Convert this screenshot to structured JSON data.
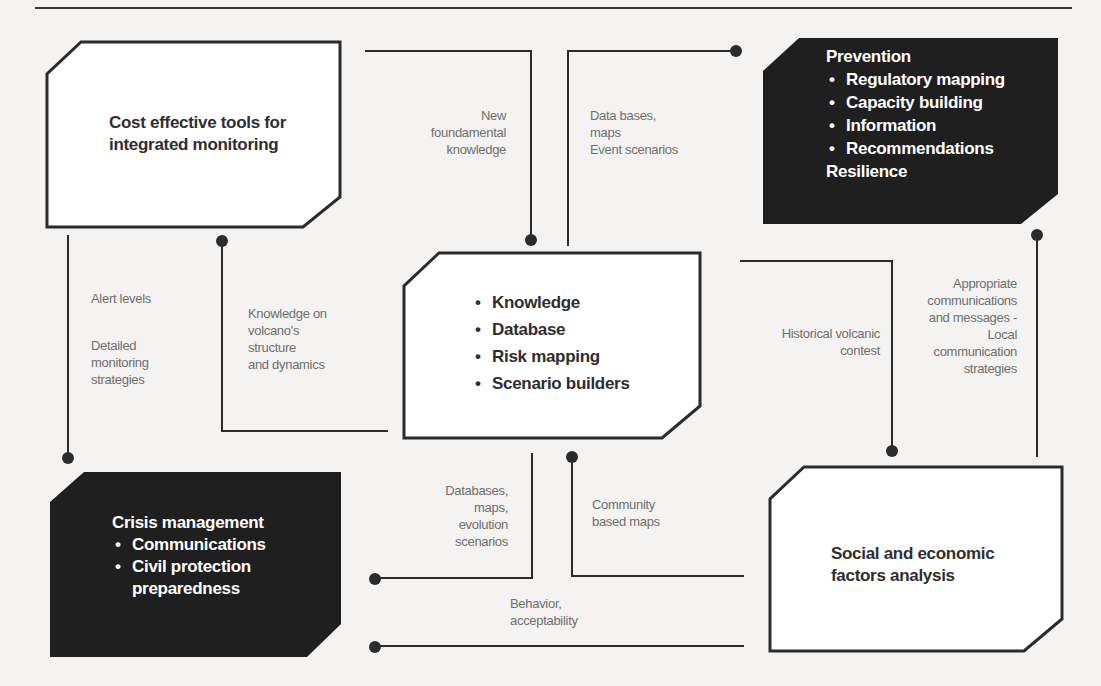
{
  "nodes": {
    "monitoring": {
      "title": "Cost effective tools for integrated monitoring",
      "line1": "Cost effective tools for",
      "line2": "integrated monitoring",
      "style": "light"
    },
    "prevention": {
      "title": "Prevention",
      "items": [
        "Regulatory mapping",
        "Capacity building",
        "Information",
        "Recommendations"
      ],
      "footer": "Resilience",
      "style": "dark"
    },
    "core": {
      "items": [
        "Knowledge",
        "Database",
        "Risk mapping",
        "Scenario builders"
      ],
      "style": "light"
    },
    "crisis": {
      "title": "Crisis management",
      "items": [
        "Communications",
        "Civil protection preparedness"
      ],
      "item2_line1": "Civil protection",
      "item2_line2": "preparedness",
      "style": "dark"
    },
    "social": {
      "line1": "Social and economic",
      "line2": "factors analysis",
      "style": "light"
    }
  },
  "edges": {
    "new_knowledge": {
      "lines": [
        "New",
        "foundamental",
        "knowledge"
      ]
    },
    "data_bases_maps": {
      "lines": [
        "Data bases,",
        "maps",
        "Event scenarios"
      ]
    },
    "alert_levels": {
      "lines": [
        "Alert levels"
      ]
    },
    "detailed_monitoring": {
      "lines": [
        "Detailed",
        "monitoring",
        "strategies"
      ]
    },
    "volcano_knowledge": {
      "lines": [
        "Knowledge on",
        "volcano's",
        "structure",
        "and dynamics"
      ]
    },
    "historical_context": {
      "lines": [
        "Historical volcanic",
        "contest"
      ]
    },
    "appropriate_comms": {
      "lines": [
        "Appropriate",
        "communications",
        "and messages -",
        "Local",
        "communication",
        "strategies"
      ]
    },
    "databases_evolution": {
      "lines": [
        "Databases,",
        "maps,",
        "evolution",
        "scenarios"
      ]
    },
    "community_maps": {
      "lines": [
        "Community",
        "based maps"
      ]
    },
    "behavior": {
      "lines": [
        "Behavior,",
        "acceptability"
      ]
    }
  },
  "colors": {
    "dark_box": "#1f1f1f",
    "line": "#2b2b2b",
    "background": "#f4f3f1",
    "label_text": "#6e6e6e"
  }
}
